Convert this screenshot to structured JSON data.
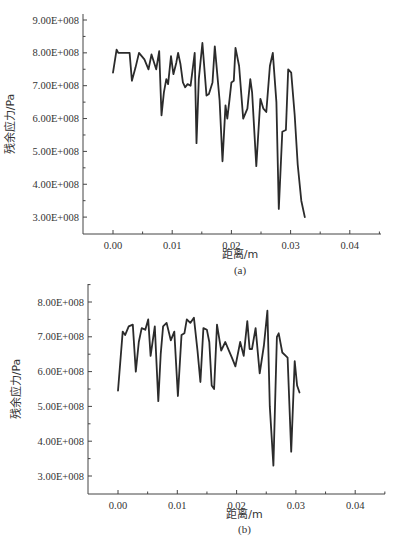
{
  "chart_data": [
    {
      "type": "line",
      "panel_label": "(a)",
      "title": "",
      "xlabel": "距离/m",
      "ylabel": "残余应力/Pa",
      "xlim": [
        -0.005,
        0.045
      ],
      "ylim": [
        250000000.0,
        900000000.0
      ],
      "xticks": [
        0.0,
        0.01,
        0.02,
        0.03,
        0.04
      ],
      "xtick_labels": [
        "0.00",
        "0.01",
        "0.02",
        "0.03",
        "0.04"
      ],
      "yticks": [
        300000000.0,
        400000000.0,
        500000000.0,
        600000000.0,
        700000000.0,
        800000000.0,
        900000000.0
      ],
      "ytick_labels": [
        "3.00E+008",
        "4.00E+008",
        "5.00E+008",
        "6.00E+008",
        "7.00E+008",
        "8.00E+008",
        "9.00E+008"
      ],
      "grid": false,
      "legend": null,
      "series": [
        {
          "name": "residual stress (a)",
          "x": [
            0.0,
            0.0006,
            0.0009,
            0.0015,
            0.0022,
            0.0028,
            0.0032,
            0.0038,
            0.0044,
            0.0053,
            0.006,
            0.0065,
            0.0073,
            0.0078,
            0.0082,
            0.0086,
            0.009,
            0.0093,
            0.0098,
            0.0102,
            0.0107,
            0.011,
            0.0114,
            0.0118,
            0.0122,
            0.0126,
            0.0131,
            0.0138,
            0.0141,
            0.0145,
            0.0151,
            0.0158,
            0.0162,
            0.0168,
            0.0172,
            0.018,
            0.0185,
            0.019,
            0.0193,
            0.0197,
            0.02,
            0.0204,
            0.0207,
            0.0213,
            0.022,
            0.0227,
            0.0232,
            0.0235,
            0.0242,
            0.0249,
            0.0254,
            0.0259,
            0.0265,
            0.027,
            0.0276,
            0.028,
            0.0286,
            0.0292,
            0.0296,
            0.0301,
            0.0307,
            0.0312,
            0.0318,
            0.0324,
            0.0328,
            0.0334,
            0.0339,
            0.0344,
            0.0349,
            0.0354,
            0.0358,
            0.0363,
            0.0368,
            0.0375,
            0.0379,
            0.0385,
            0.0392,
            0.0399,
            0.0405
          ],
          "values": [
            740000000.0,
            810000000.0,
            800000000.0,
            800000000.0,
            800000000.0,
            800000000.0,
            715000000.0,
            755000000.0,
            800000000.0,
            780000000.0,
            750000000.0,
            795000000.0,
            750000000.0,
            805000000.0,
            610000000.0,
            680000000.0,
            720000000.0,
            705000000.0,
            790000000.0,
            735000000.0,
            770000000.0,
            800000000.0,
            765000000.0,
            710000000.0,
            695000000.0,
            705000000.0,
            700000000.0,
            800000000.0,
            525000000.0,
            720000000.0,
            830000000.0,
            670000000.0,
            675000000.0,
            710000000.0,
            820000000.0,
            655000000.0,
            470000000.0,
            640000000.0,
            600000000.0,
            660000000.0,
            710000000.0,
            715000000.0,
            815000000.0,
            760000000.0,
            600000000.0,
            630000000.0,
            720000000.0,
            680000000.0,
            455000000.0,
            660000000.0,
            630000000.0,
            620000000.0,
            760000000.0,
            800000000.0,
            650000000.0,
            325000000.0,
            560000000.0,
            565000000.0,
            750000000.0,
            740000000.0,
            610000000.0,
            460000000.0,
            350000000.0,
            300000000.0
          ],
          "color": "#2b2b2b"
        }
      ]
    },
    {
      "type": "line",
      "panel_label": "(b)",
      "title": "",
      "xlabel": "距离/m",
      "ylabel": "残余应力/Pa",
      "xlim": [
        -0.005,
        0.045
      ],
      "ylim": [
        250000000.0,
        850000000.0
      ],
      "xticks": [
        0.0,
        0.01,
        0.02,
        0.03,
        0.04
      ],
      "xtick_labels": [
        "0.00",
        "0.01",
        "0.02",
        "0.03",
        "0.04"
      ],
      "yticks": [
        300000000.0,
        400000000.0,
        500000000.0,
        600000000.0,
        700000000.0,
        800000000.0
      ],
      "ytick_labels": [
        "3.00E+008",
        "4.00E+008",
        "5.00E+008",
        "6.00E+008",
        "7.00E+008",
        "8.00E+008"
      ],
      "grid": false,
      "legend": null,
      "series": [
        {
          "name": "residual stress (b)",
          "x": [
            0.0,
            0.0008,
            0.0012,
            0.0018,
            0.0025,
            0.003,
            0.0035,
            0.004,
            0.0046,
            0.0051,
            0.0055,
            0.0062,
            0.0068,
            0.0072,
            0.0076,
            0.0082,
            0.0089,
            0.0095,
            0.0101,
            0.0107,
            0.0112,
            0.0116,
            0.0122,
            0.0128,
            0.0134,
            0.0139,
            0.0144,
            0.015,
            0.0154,
            0.0158,
            0.0162,
            0.0167,
            0.0174,
            0.0181,
            0.0187,
            0.0192,
            0.0198,
            0.0206,
            0.0212,
            0.0218,
            0.0222,
            0.0226,
            0.0232,
            0.0239,
            0.0246,
            0.0252,
            0.0256,
            0.0262,
            0.0268,
            0.0271,
            0.0277,
            0.0283,
            0.0286,
            0.0292,
            0.0298,
            0.0302,
            0.0306,
            0.0311,
            0.0314,
            0.032,
            0.0326,
            0.0333,
            0.0339,
            0.0345,
            0.0352,
            0.0358,
            0.0364,
            0.0368,
            0.0373,
            0.0378,
            0.0385,
            0.0392,
            0.0396
          ],
          "values": [
            545000000.0,
            715000000.0,
            705000000.0,
            730000000.0,
            735000000.0,
            600000000.0,
            685000000.0,
            725000000.0,
            720000000.0,
            750000000.0,
            645000000.0,
            730000000.0,
            515000000.0,
            650000000.0,
            730000000.0,
            740000000.0,
            690000000.0,
            715000000.0,
            530000000.0,
            705000000.0,
            710000000.0,
            750000000.0,
            740000000.0,
            755000000.0,
            660000000.0,
            570000000.0,
            725000000.0,
            720000000.0,
            685000000.0,
            560000000.0,
            550000000.0,
            735000000.0,
            660000000.0,
            685000000.0,
            660000000.0,
            640000000.0,
            615000000.0,
            685000000.0,
            645000000.0,
            745000000.0,
            665000000.0,
            665000000.0,
            725000000.0,
            595000000.0,
            675000000.0,
            775000000.0,
            500000000.0,
            330000000.0,
            700000000.0,
            710000000.0,
            655000000.0,
            645000000.0,
            640000000.0,
            370000000.0,
            630000000.0,
            560000000.0,
            540000000.0
          ],
          "color": "#2b2b2b"
        }
      ]
    }
  ]
}
